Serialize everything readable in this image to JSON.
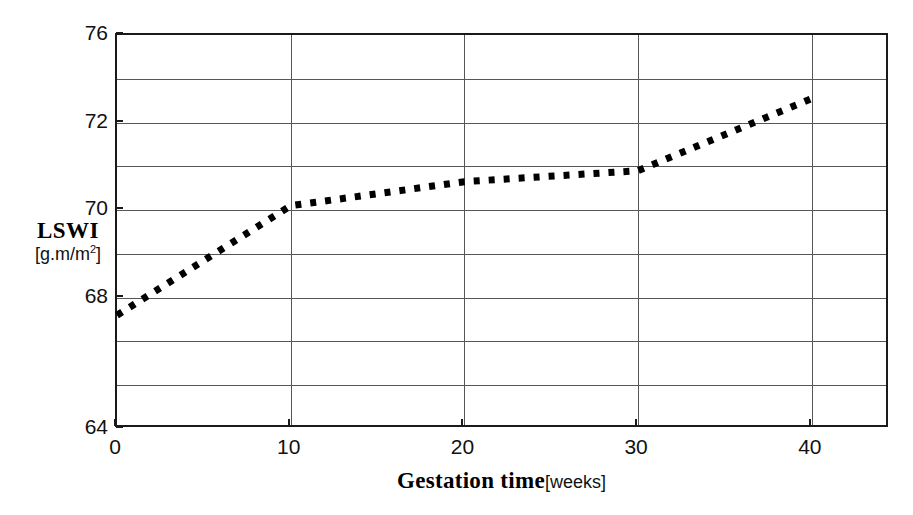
{
  "chart_data": {
    "type": "line",
    "title": "",
    "subtitle": "",
    "xlabel": "Gestation time",
    "xlabel_units": "[weeks]",
    "ylabel": "LSWI",
    "ylabel_units": "[g.m/m",
    "ylabel_units_sup": "2",
    "ylabel_units_tail": "]",
    "x": [
      0,
      10,
      20,
      30,
      40
    ],
    "series": [
      {
        "name": "LSWI",
        "style": "dotted",
        "color": "#000000",
        "values": [
          67.6,
          70.1,
          70.65,
          70.9,
          73.1
        ]
      }
    ],
    "xlim": [
      0,
      44.5
    ],
    "ylim": [
      64,
      76
    ],
    "xticks": [
      0,
      10,
      20,
      30,
      40
    ],
    "xtick_labels": [
      "0",
      "10",
      "20",
      "30",
      "40"
    ],
    "yticks": [
      64,
      68,
      70,
      72,
      76
    ],
    "ytick_labels": [
      "64",
      "68",
      "70",
      "72",
      "76"
    ],
    "y_axis_scale": "nonlinear-banded",
    "y_band_breaks": [
      64,
      66,
      67,
      68,
      69,
      70,
      71,
      72,
      74,
      76
    ],
    "grid": {
      "horizontal": true,
      "vertical": true,
      "color": "#565656"
    },
    "legend": {
      "visible": false,
      "position": "none",
      "entries": []
    },
    "frame_color": "#1a1a1a",
    "background": "#ffffff"
  }
}
